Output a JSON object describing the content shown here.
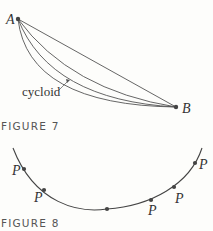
{
  "figure7": {
    "caption": "FIGURE 7",
    "point_a_label": "A",
    "point_b_label": "B",
    "curve_label": "cycloid"
  },
  "figure8": {
    "caption": "FIGURE 8",
    "point_labels": [
      "P",
      "P",
      "P",
      "P",
      "P"
    ]
  }
}
